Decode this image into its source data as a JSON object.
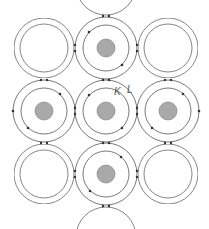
{
  "diagram": {
    "labels": {
      "k_shell": "K",
      "l_shell": "L"
    },
    "colors": {
      "nucleus": "#a9a9a9",
      "shell": "#555555",
      "electron": "#333333"
    },
    "atoms": [
      {
        "id": "top",
        "cx": 106,
        "cy": 48
      },
      {
        "id": "left",
        "cx": 44,
        "cy": 111
      },
      {
        "id": "center",
        "cx": 106,
        "cy": 111
      },
      {
        "id": "right",
        "cx": 168,
        "cy": 111
      },
      {
        "id": "bottom",
        "cx": 106,
        "cy": 174
      }
    ]
  }
}
